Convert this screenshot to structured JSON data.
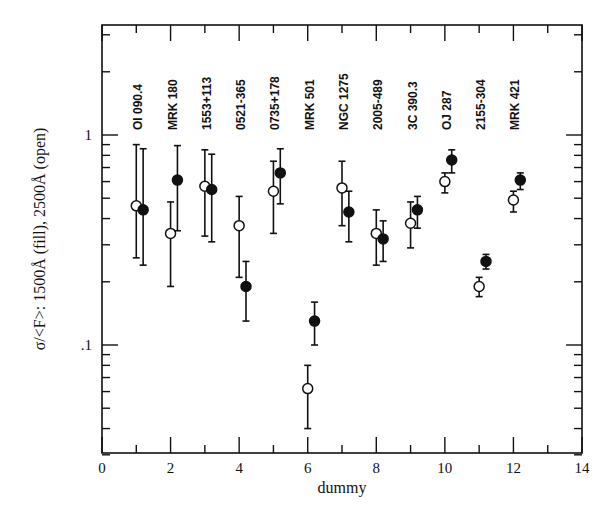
{
  "chart_data": {
    "type": "scatter",
    "title": "",
    "xlabel": "dummy",
    "ylabel": "σ/<F>: 1500Å (fill), 2500Å (open)",
    "xlim": [
      0,
      14
    ],
    "ylim": [
      0.03,
      3.2
    ],
    "yscale": "log",
    "grid": false,
    "legend": null,
    "x_ticks": [
      0,
      2,
      4,
      6,
      8,
      10,
      12,
      14
    ],
    "x_tick_labels": [
      "0",
      "2",
      "4",
      "6",
      "8",
      "10",
      "12",
      "14"
    ],
    "y_ticks": [
      0.1,
      1
    ],
    "y_tick_labels": [
      ".1",
      "1"
    ],
    "annotations": [
      {
        "x": 1,
        "text": "OI 090.4"
      },
      {
        "x": 2,
        "text": "MRK 180"
      },
      {
        "x": 3,
        "text": "1553+113"
      },
      {
        "x": 4,
        "text": "0521-365"
      },
      {
        "x": 5,
        "text": "0735+178"
      },
      {
        "x": 6,
        "text": "MRK 501"
      },
      {
        "x": 7,
        "text": "NGC 1275"
      },
      {
        "x": 8,
        "text": "2005-489"
      },
      {
        "x": 9,
        "text": "3C 390.3"
      },
      {
        "x": 10,
        "text": "OJ 287"
      },
      {
        "x": 11,
        "text": "2155-304"
      },
      {
        "x": 12,
        "text": "MRK 421"
      }
    ],
    "series": [
      {
        "name": "2500Å (open)",
        "marker": "open-circle",
        "x": [
          1,
          2,
          3,
          4,
          5,
          6,
          7,
          8,
          9,
          10,
          11,
          12
        ],
        "y": [
          0.46,
          0.34,
          0.57,
          0.37,
          0.54,
          0.062,
          0.56,
          0.34,
          0.38,
          0.6,
          0.19,
          0.49
        ],
        "y_upper": [
          0.9,
          0.48,
          0.85,
          0.51,
          0.75,
          0.08,
          0.75,
          0.44,
          0.48,
          0.66,
          0.21,
          0.54
        ],
        "y_lower": [
          0.26,
          0.19,
          0.33,
          0.21,
          0.34,
          0.04,
          0.37,
          0.24,
          0.29,
          0.53,
          0.17,
          0.43
        ]
      },
      {
        "name": "1500Å (fill)",
        "marker": "filled-circle",
        "x": [
          1.2,
          2.2,
          3.2,
          4.2,
          5.2,
          6.2,
          7.2,
          8.2,
          9.2,
          10.2,
          11.2,
          12.2
        ],
        "y": [
          0.44,
          0.61,
          0.55,
          0.19,
          0.66,
          0.13,
          0.43,
          0.32,
          0.44,
          0.76,
          0.25,
          0.61
        ],
        "y_upper": [
          0.86,
          0.89,
          0.81,
          0.25,
          0.86,
          0.16,
          0.54,
          0.39,
          0.51,
          0.85,
          0.27,
          0.66
        ],
        "y_lower": [
          0.24,
          0.35,
          0.31,
          0.13,
          0.47,
          0.1,
          0.31,
          0.25,
          0.36,
          0.66,
          0.23,
          0.55
        ]
      }
    ]
  }
}
